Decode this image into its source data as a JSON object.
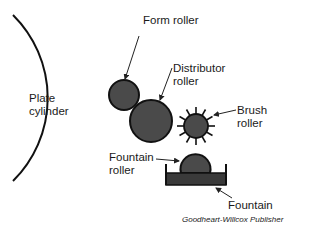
{
  "diagram": {
    "labels": {
      "plate_cylinder": "Plate\ncylinder",
      "form_roller": "Form roller",
      "distributor_roller": "Distributor\nroller",
      "brush_roller": "Brush\nroller",
      "fountain_roller": "Fountain\nroller",
      "fountain": "Fountain"
    },
    "credit": "Goodheart-Willcox Publisher",
    "colors": {
      "roller_fill": "#4a4a4a",
      "outline": "#111111",
      "fountain_ink": "#3a3a3a",
      "background": "#ffffff"
    }
  }
}
